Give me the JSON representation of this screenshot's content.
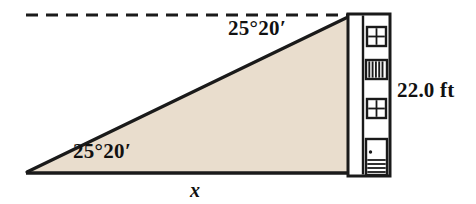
{
  "figure": {
    "labels": {
      "angle_of_depression": "25°20′",
      "angle_of_elevation": "25°20′",
      "base_variable": "x",
      "building_height": "22.0 ft"
    },
    "colors": {
      "triangle_fill": "#e9ddcd",
      "stroke": "#1a1a1a",
      "background": "#ffffff",
      "building_fill": "#ffffff",
      "window_fill": "#ffffff",
      "vent_fill": "#ffffff"
    },
    "geometry": {
      "dashed_line": {
        "x1": 26,
        "y1": 15,
        "x2": 349,
        "y2": 15,
        "dash": "11 7"
      },
      "triangle": {
        "left_vertex": {
          "x": 27,
          "y": 172
        },
        "top_right_vertex": {
          "x": 348,
          "y": 17
        },
        "bottom_right_vertex": {
          "x": 348,
          "y": 172
        }
      },
      "building": {
        "x": 348,
        "y": 14,
        "width": 42,
        "height": 162
      }
    },
    "building_features": [
      {
        "name": "window-upper",
        "type": "four-pane-window"
      },
      {
        "name": "vent-louver",
        "type": "louvered-vent"
      },
      {
        "name": "window-lower",
        "type": "four-pane-window"
      },
      {
        "name": "door",
        "type": "door-with-steps"
      }
    ]
  }
}
